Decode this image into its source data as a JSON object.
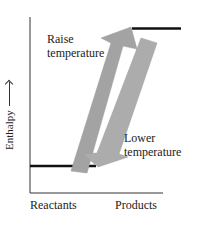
{
  "diagram": {
    "type": "enthalpy-level-diagram",
    "y_axis_label": "Enthalpy",
    "y_axis_arrow": "up-arrow",
    "x_axis_labels": [
      "Reactants",
      "Products"
    ],
    "levels": [
      {
        "name": "Reactants",
        "relative_enthalpy": "low"
      },
      {
        "name": "Products",
        "relative_enthalpy": "high"
      }
    ],
    "arrows": [
      {
        "label_line1": "Raise",
        "label_line2": "temperature",
        "direction": "up",
        "from": "Reactants",
        "to": "Products"
      },
      {
        "label_line1": "Lower",
        "label_line2": "temperature",
        "direction": "down",
        "from": "Products",
        "to": "Reactants"
      }
    ],
    "colors": {
      "axis": "#222222",
      "level_line": "#111111",
      "arrow_fill": "#a6a6a6",
      "arrow_fill_dark": "#9a9a9a",
      "background": "#ffffff"
    }
  }
}
